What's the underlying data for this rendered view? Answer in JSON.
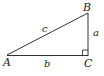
{
  "diagram": {
    "type": "right-triangle",
    "stroke_color": "#333333",
    "vertices": [
      {
        "label": "A",
        "x": 7,
        "y": 55
      },
      {
        "label": "B",
        "x": 88,
        "y": 13
      },
      {
        "label": "C",
        "x": 88,
        "y": 55
      }
    ],
    "sides": [
      {
        "label": "c",
        "from": "A",
        "to": "B"
      },
      {
        "label": "a",
        "from": "B",
        "to": "C"
      },
      {
        "label": "b",
        "from": "A",
        "to": "C"
      }
    ],
    "right_angle_at": "C"
  }
}
